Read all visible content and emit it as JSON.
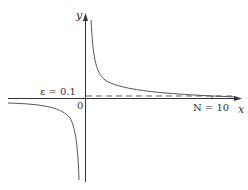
{
  "diagram": {
    "title": "",
    "function": "y = 1/x",
    "axes": {
      "x_label": "x",
      "y_label": "y",
      "origin_label": "0"
    },
    "annotations": {
      "epsilon_label": "ε = 0.1",
      "n_label": "N = 10"
    },
    "values": {
      "epsilon": 0.1,
      "N": 10
    },
    "colors": {
      "axis": "#333333",
      "curve": "#555555",
      "dashed_line": "#333333",
      "background": "#ffffff"
    }
  }
}
